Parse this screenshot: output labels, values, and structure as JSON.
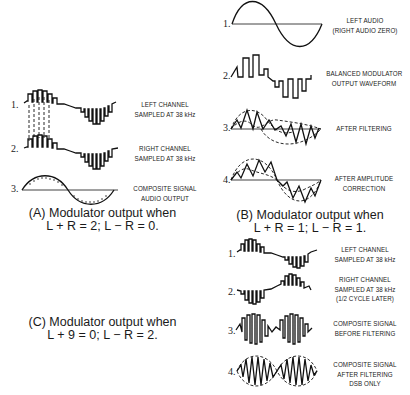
{
  "panel_a": {
    "caption_line1": "(A) Modulator output when",
    "caption_line2": "L + R = 2; L − R = 0.",
    "rows": [
      {
        "number": "1.",
        "label_line1": "LEFT CHANNEL",
        "label_line2": "SAMPLED AT 38 kHz"
      },
      {
        "number": "2.",
        "label_line1": "RIGHT CHANNEL",
        "label_line2": "SAMPLED AT 38 kHz"
      },
      {
        "number": "3.",
        "label_line1": "COMPOSITE SIGNAL",
        "label_line2": "AUDIO OUTPUT"
      }
    ]
  },
  "panel_b": {
    "caption_line1": "(B) Modulator output when",
    "caption_line2": "L + R = 1; L − R = 1.",
    "rows": [
      {
        "number": "1.",
        "label_line1": "LEFT AUDIO",
        "label_line2": "(RIGHT AUDIO ZERO)"
      },
      {
        "number": "2.",
        "label_line1": "BALANCED MODULATOR",
        "label_line2": "OUTPUT WAVEFORM"
      },
      {
        "number": "3.",
        "label_line1": "AFTER FILTERING",
        "label_line2": ""
      },
      {
        "number": "4.",
        "label_line1": "AFTER AMPLITUDE",
        "label_line2": "CORRECTION"
      }
    ]
  },
  "panel_c": {
    "caption_line1": "(C) Modulator output when",
    "caption_line2": "L + 9 = 0; L − R = 2.",
    "rows": [
      {
        "number": "1.",
        "label_line1": "LEFT CHANNEL",
        "label_line2": "SAMPLED AT 38 kHz",
        "label_line3": ""
      },
      {
        "number": "2.",
        "label_line1": "RIGHT CHANNEL",
        "label_line2": "SAMPLED AT 38 kHz",
        "label_line3": "(1/2 CYCLE LATER)"
      },
      {
        "number": "3.",
        "label_line1": "COMPOSITE SIGNAL",
        "label_line2": "BEFORE FILTERING",
        "label_line3": ""
      },
      {
        "number": "4.",
        "label_line1": "COMPOSITE SIGNAL",
        "label_line2": "AFTER FILTERING",
        "label_line3": "DSB ONLY"
      }
    ]
  }
}
